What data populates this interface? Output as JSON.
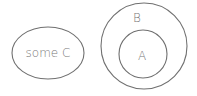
{
  "diagram": {
    "type": "euler",
    "colors": {
      "stroke": "#707070",
      "text": "#777777",
      "background": "#ffffff"
    },
    "sets": [
      {
        "id": "C",
        "label": "some C",
        "shape": "ellipse"
      },
      {
        "id": "B",
        "label": "B",
        "shape": "circle"
      },
      {
        "id": "A",
        "label": "A",
        "shape": "circle",
        "inside": "B"
      }
    ]
  }
}
